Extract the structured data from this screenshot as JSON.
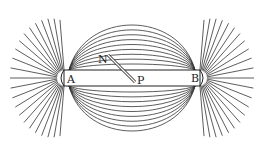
{
  "diagram": {
    "labels": {
      "pole_a": "A",
      "pole_b": "B",
      "needle_n": "N",
      "point_p": "P"
    },
    "colors": {
      "ink": "#222222",
      "background": "#ffffff"
    }
  }
}
